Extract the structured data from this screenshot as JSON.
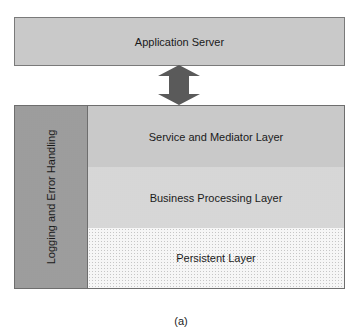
{
  "diagram": {
    "top_box": {
      "label": "Application Server"
    },
    "connector": {
      "type": "bidirectional-arrow",
      "color": "#5a5a5a"
    },
    "side_panel": {
      "label": "Logging and Error Handling"
    },
    "layers": [
      {
        "label": "Service and Mediator Layer"
      },
      {
        "label": "Business Processing Layer"
      },
      {
        "label": "Persistent Layer"
      }
    ],
    "caption": "(a)"
  }
}
